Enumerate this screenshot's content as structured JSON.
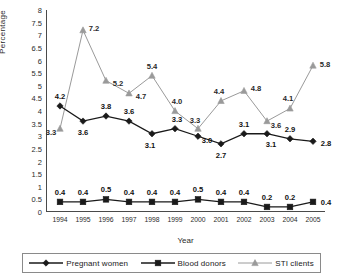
{
  "chart_data": {
    "type": "line",
    "title": "",
    "xlabel": "Year",
    "ylabel": "Percentage",
    "categories": [
      "1994",
      "1995",
      "1996",
      "1997",
      "1998",
      "1999",
      "2000",
      "2001",
      "2002",
      "2003",
      "2004",
      "2005"
    ],
    "ylim": [
      0,
      8
    ],
    "ytick_step": 0.5,
    "yticks": [
      "8",
      "7.5",
      "7",
      "6.5",
      "6",
      "5.5",
      "5",
      "4.5",
      "4",
      "3.5",
      "3",
      "2.5",
      "2",
      "1.5",
      "1",
      "0.5",
      "0"
    ],
    "grid": false,
    "legend_position": "bottom",
    "series": [
      {
        "name": "Pregnant women",
        "marker": "diamond",
        "color": "#1a1a1a",
        "values": [
          4.2,
          3.6,
          3.8,
          3.6,
          3.1,
          3.3,
          3.0,
          2.7,
          3.1,
          3.1,
          2.9,
          2.8
        ],
        "labels": [
          "4.2",
          "3.6",
          "3.8",
          "3.6",
          "3.1",
          "3.3",
          "3.0",
          "2.7",
          "3.1",
          "3.1",
          "2.9",
          "2.8"
        ]
      },
      {
        "name": "Blood donors",
        "marker": "square",
        "color": "#1a1a1a",
        "values": [
          0.4,
          0.4,
          0.5,
          0.4,
          0.4,
          0.4,
          0.5,
          0.4,
          0.4,
          0.2,
          0.2,
          0.4
        ],
        "labels": [
          "0.4",
          "0.4",
          "0.5",
          "0.4",
          "0.4",
          "0.4",
          "0.5",
          "0.4",
          "0.4",
          "0.2",
          "0.2",
          "0.4"
        ]
      },
      {
        "name": "STI clients",
        "marker": "triangle",
        "color": "#9a9a9a",
        "values": [
          3.3,
          7.2,
          5.2,
          4.7,
          5.4,
          4.0,
          3.3,
          4.4,
          4.8,
          3.6,
          4.1,
          5.8
        ],
        "labels": [
          "3.3",
          "7.2",
          "5.2",
          "4.7",
          "5.4",
          "4.0",
          "3.3",
          "4.4",
          "4.8",
          "3.6",
          "4.1",
          "5.8"
        ]
      }
    ]
  },
  "legend": {
    "items": [
      {
        "label": "Pregnant women",
        "marker": "diamond-marker-icon"
      },
      {
        "label": "Blood donors",
        "marker": "square-marker-icon"
      },
      {
        "label": "STI clients",
        "marker": "triangle-marker-icon"
      }
    ]
  }
}
